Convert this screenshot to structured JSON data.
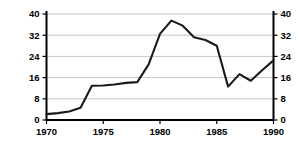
{
  "chart_data": {
    "type": "line",
    "title": "",
    "xlabel": "",
    "ylabel_line1": "Dollars per Billion Barrels",
    "ylabel_line2": "(average for year)",
    "ylabel_full": "Dollars per Billion Barrels (average for year)",
    "xlim": [
      1970,
      1990
    ],
    "ylim": [
      0,
      40
    ],
    "yticks": [
      0,
      8,
      16,
      24,
      32,
      40
    ],
    "ytick_labels": [
      "0",
      "8",
      "16",
      "24",
      "32",
      "40"
    ],
    "yticks_right": [
      0,
      8,
      16,
      24,
      32,
      40
    ],
    "ytick_labels_right": [
      "0",
      "8",
      "16",
      "24",
      "32",
      "40"
    ],
    "xticks": [
      1970,
      1975,
      1980,
      1985,
      1990
    ],
    "xtick_labels": [
      "1970",
      "1975",
      "1980",
      "1985",
      "1990"
    ],
    "grid": true,
    "grid_axis": "y",
    "legend": false,
    "legend_position": "none",
    "line_color": "#1a1a1a",
    "grid_color": "#b9b9b9",
    "axis_color": "#000000",
    "x": [
      1970,
      1971,
      1972,
      1973,
      1974,
      1975,
      1976,
      1977,
      1978,
      1979,
      1980,
      1981,
      1982,
      1983,
      1984,
      1985,
      1986,
      1987,
      1988,
      1989,
      1990
    ],
    "values": [
      2.2,
      2.6,
      3.2,
      4.6,
      12.9,
      13.0,
      13.4,
      14.0,
      14.3,
      21.0,
      32.5,
      37.5,
      35.6,
      31.2,
      30.2,
      28.0,
      12.6,
      17.3,
      14.8,
      18.8,
      22.5
    ],
    "series": [
      {
        "name": "Dollars per Billion Barrels",
        "values": [
          2.2,
          2.6,
          3.2,
          4.6,
          12.9,
          13.0,
          13.4,
          14.0,
          14.3,
          21.0,
          32.5,
          37.5,
          35.6,
          31.2,
          30.2,
          28.0,
          12.6,
          17.3,
          14.8,
          18.8,
          22.5
        ]
      }
    ]
  }
}
